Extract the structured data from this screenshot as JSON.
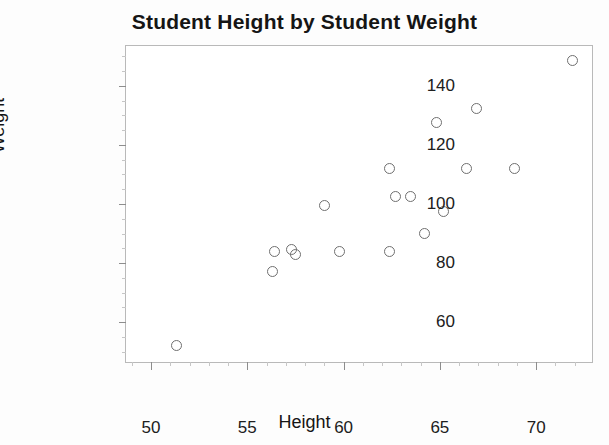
{
  "chart_data": {
    "type": "scatter",
    "title": "Student Height by Student Weight",
    "xlabel": "Height",
    "ylabel": "Weight",
    "xlim": [
      48.7,
      72.9
    ],
    "ylim": [
      46.5,
      153.5
    ],
    "xticks": [
      50,
      55,
      60,
      65,
      70
    ],
    "yticks": [
      60,
      80,
      100,
      120,
      140
    ],
    "grid": false,
    "legend": null,
    "marker": {
      "shape": "open-circle",
      "edge_color": "#6f6f6f",
      "fill_color": "none",
      "size": 11
    },
    "frame_color": "#b9b9b9",
    "background_color": "#ffffff",
    "points": [
      {
        "x": 51.3,
        "y": 52.0
      },
      {
        "x": 56.3,
        "y": 77.0
      },
      {
        "x": 56.4,
        "y": 84.0
      },
      {
        "x": 57.3,
        "y": 84.5
      },
      {
        "x": 57.5,
        "y": 83.0
      },
      {
        "x": 59.0,
        "y": 99.5
      },
      {
        "x": 59.8,
        "y": 84.0
      },
      {
        "x": 62.4,
        "y": 84.0
      },
      {
        "x": 62.4,
        "y": 112.0
      },
      {
        "x": 62.7,
        "y": 102.5
      },
      {
        "x": 63.5,
        "y": 102.5
      },
      {
        "x": 64.2,
        "y": 90.0
      },
      {
        "x": 64.8,
        "y": 127.5
      },
      {
        "x": 65.2,
        "y": 97.5
      },
      {
        "x": 66.4,
        "y": 112.0
      },
      {
        "x": 66.9,
        "y": 132.5
      },
      {
        "x": 68.9,
        "y": 112.0
      },
      {
        "x": 71.9,
        "y": 148.5
      }
    ]
  }
}
